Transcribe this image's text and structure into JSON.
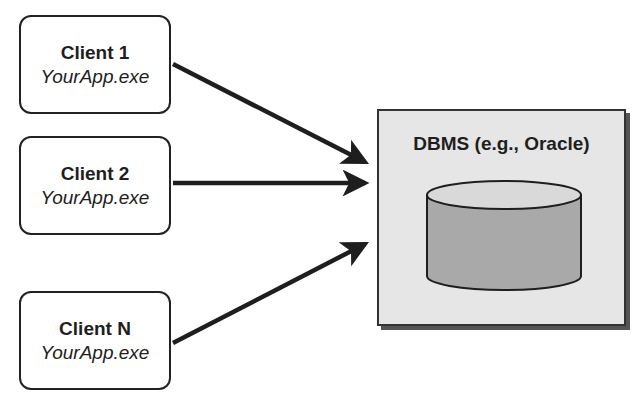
{
  "diagram": {
    "clients": [
      {
        "title": "Client 1",
        "subtitle": "YourApp.exe"
      },
      {
        "title": "Client 2",
        "subtitle": "YourApp.exe"
      },
      {
        "title": "Client N",
        "subtitle": "YourApp.exe"
      }
    ],
    "server": {
      "title": "DBMS (e.g., Oracle)"
    },
    "colors": {
      "stroke": "#1e1e1e",
      "server_fill": "#e6e6e6",
      "cylinder_top": "#d9d9d9",
      "cylinder_body": "#a9a9a9"
    }
  }
}
